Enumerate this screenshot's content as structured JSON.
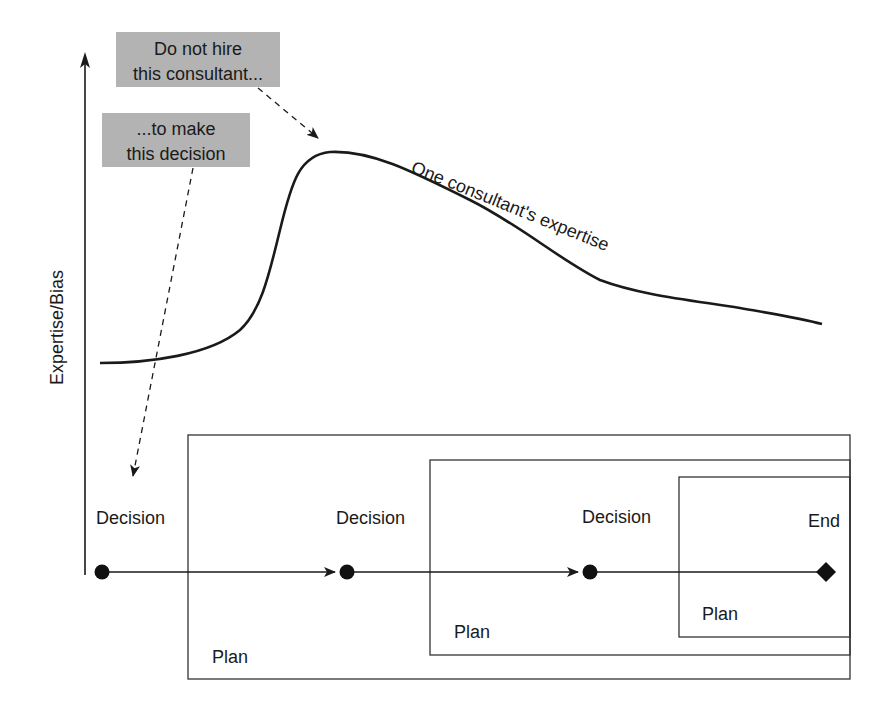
{
  "diagram": {
    "y_axis_label": "Expertise/Bias",
    "curve_label": "One consultant's expertise",
    "callouts": [
      {
        "line1": "Do not hire",
        "line2": "this consultant..."
      },
      {
        "line1": "...to make",
        "line2": "this decision"
      }
    ],
    "timeline": {
      "nodes": [
        {
          "label": "Decision",
          "shape": "circle"
        },
        {
          "label": "Decision",
          "shape": "circle"
        },
        {
          "label": "Decision",
          "shape": "circle"
        },
        {
          "label": "End",
          "shape": "diamond"
        }
      ],
      "plans": [
        {
          "label": "Plan"
        },
        {
          "label": "Plan"
        },
        {
          "label": "Plan"
        }
      ]
    },
    "colors": {
      "ink": "#1a1a1a",
      "callout_fill": "#b3b3b3",
      "background": "#ffffff"
    }
  }
}
